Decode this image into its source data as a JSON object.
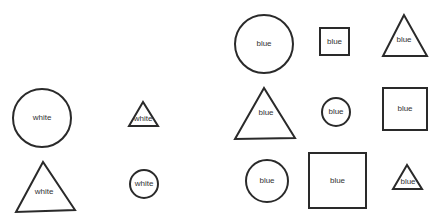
{
  "colors": {
    "stroke": "#2a2a2a",
    "text": "#333333",
    "background": "#ffffff"
  },
  "groups": [
    {
      "name": "white-group",
      "shapes": [
        {
          "type": "circle",
          "label": "white",
          "cx": 42,
          "cy": 118,
          "r": 29
        },
        {
          "type": "triangle",
          "label": "white",
          "points": "143,102 129,126 158,126",
          "lx": 143,
          "ly": 119
        },
        {
          "type": "triangle",
          "label": "white",
          "points": "43,162 16,212 75,210",
          "lx": 44,
          "ly": 192
        },
        {
          "type": "circle",
          "label": "white",
          "cx": 144,
          "cy": 184,
          "r": 14
        }
      ]
    },
    {
      "name": "blue-group",
      "shapes": [
        {
          "type": "circle",
          "label": "blue",
          "cx": 264,
          "cy": 44,
          "r": 29
        },
        {
          "type": "square",
          "label": "blue",
          "x": 320,
          "y": 28,
          "w": 29,
          "h": 27
        },
        {
          "type": "triangle",
          "label": "blue",
          "points": "404,15 383,56 427,56",
          "lx": 404,
          "ly": 40
        },
        {
          "type": "triangle",
          "label": "blue",
          "points": "264,88 235,139 295,138",
          "lx": 266,
          "ly": 113
        },
        {
          "type": "circle",
          "label": "blue",
          "cx": 336,
          "cy": 112,
          "r": 14
        },
        {
          "type": "square",
          "label": "blue",
          "x": 383,
          "y": 88,
          "w": 44,
          "h": 42
        },
        {
          "type": "circle",
          "label": "blue",
          "cx": 267,
          "cy": 181,
          "r": 21
        },
        {
          "type": "square",
          "label": "blue",
          "x": 309,
          "y": 153,
          "w": 57,
          "h": 55
        },
        {
          "type": "triangle",
          "label": "blue",
          "points": "407,165 393,189 422,189",
          "lx": 408,
          "ly": 182
        }
      ]
    }
  ]
}
